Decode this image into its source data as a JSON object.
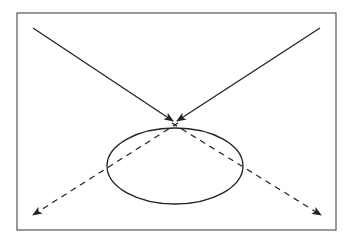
{
  "diagram": {
    "title": "",
    "colors": {
      "background": "#ffffff",
      "frame": "#555555",
      "stroke": "#222222"
    },
    "frame": {
      "x": 17,
      "y": 13,
      "width": 319,
      "height": 217
    },
    "ellipse": {
      "cx": 175,
      "cy": 166,
      "rx": 68,
      "ry": 38
    },
    "incoming_rays": [
      {
        "name": "incoming-ray-left",
        "x1": 33,
        "y1": 28,
        "x2": 173,
        "y2": 121,
        "style": "solid"
      },
      {
        "name": "incoming-ray-right",
        "x1": 320,
        "y1": 28,
        "x2": 177,
        "y2": 121,
        "style": "solid"
      }
    ],
    "outgoing_rays": [
      {
        "name": "outgoing-ray-left",
        "x1": 178,
        "y1": 123,
        "x2": 33,
        "y2": 215,
        "style": "dashed"
      },
      {
        "name": "outgoing-ray-right",
        "x1": 172,
        "y1": 123,
        "x2": 321,
        "y2": 215,
        "style": "dashed"
      }
    ]
  }
}
